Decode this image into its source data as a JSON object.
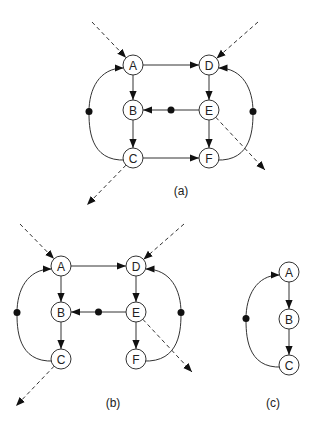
{
  "diagrams": [
    {
      "id": "a",
      "label": "(a)",
      "label_pos": [
        181,
        195
      ],
      "nodes": [
        {
          "id": "A",
          "x": 133,
          "y": 65
        },
        {
          "id": "B",
          "x": 133,
          "y": 110
        },
        {
          "id": "C",
          "x": 133,
          "y": 158
        },
        {
          "id": "D",
          "x": 209,
          "y": 65
        },
        {
          "id": "E",
          "x": 209,
          "y": 110
        },
        {
          "id": "F",
          "x": 209,
          "y": 158
        }
      ],
      "edges": [
        {
          "from": "A",
          "to": "D",
          "type": "straight"
        },
        {
          "from": "A",
          "to": "B",
          "type": "straight"
        },
        {
          "from": "B",
          "to": "C",
          "type": "straight"
        },
        {
          "from": "C",
          "to": "F",
          "type": "straight"
        },
        {
          "from": "D",
          "to": "E",
          "type": "straight"
        },
        {
          "from": "E",
          "to": "F",
          "type": "straight"
        },
        {
          "from": "E",
          "to": "B",
          "type": "straight",
          "dot": true
        },
        {
          "from": "C",
          "to": "A",
          "type": "arc",
          "bulge_x": 89,
          "dot": true
        },
        {
          "from": "F",
          "to": "D",
          "type": "arc",
          "bulge_x": 253,
          "dot": true
        }
      ],
      "dashed": [
        {
          "from": [
            92,
            22
          ],
          "to": "A",
          "arrow": "end"
        },
        {
          "from": [
            258,
            22
          ],
          "to": "D",
          "arrow": "end"
        },
        {
          "from": "C",
          "to": [
            87,
            205
          ],
          "arrow": "end"
        },
        {
          "from": "E",
          "to": [
            265,
            170
          ],
          "arrow": "end"
        }
      ]
    },
    {
      "id": "b",
      "label": "(b)",
      "label_pos": [
        113,
        407
      ],
      "nodes": [
        {
          "id": "A",
          "x": 61,
          "y": 266
        },
        {
          "id": "B",
          "x": 61,
          "y": 312
        },
        {
          "id": "C",
          "x": 61,
          "y": 359
        },
        {
          "id": "D",
          "x": 136,
          "y": 266
        },
        {
          "id": "E",
          "x": 136,
          "y": 312
        },
        {
          "id": "F",
          "x": 136,
          "y": 359
        }
      ],
      "edges": [
        {
          "from": "A",
          "to": "D",
          "type": "straight"
        },
        {
          "from": "A",
          "to": "B",
          "type": "straight"
        },
        {
          "from": "B",
          "to": "C",
          "type": "straight"
        },
        {
          "from": "D",
          "to": "E",
          "type": "straight"
        },
        {
          "from": "E",
          "to": "F",
          "type": "straight"
        },
        {
          "from": "E",
          "to": "B",
          "type": "straight",
          "dot": true
        },
        {
          "from": "C",
          "to": "A",
          "type": "arc",
          "bulge_x": 17,
          "dot": true
        },
        {
          "from": "F",
          "to": "D",
          "type": "arc",
          "bulge_x": 181,
          "dot": true
        }
      ],
      "dashed": [
        {
          "from": [
            20,
            224
          ],
          "to": "A",
          "arrow": "end"
        },
        {
          "from": [
            184,
            224
          ],
          "to": "D",
          "arrow": "end"
        },
        {
          "from": "C",
          "to": [
            16,
            406
          ],
          "arrow": "end"
        },
        {
          "from": "E",
          "to": [
            192,
            372
          ],
          "arrow": "end"
        }
      ]
    },
    {
      "id": "c",
      "label": "(c)",
      "label_pos": [
        273,
        407
      ],
      "nodes": [
        {
          "id": "A",
          "x": 289,
          "y": 272
        },
        {
          "id": "B",
          "x": 289,
          "y": 319
        },
        {
          "id": "C",
          "x": 289,
          "y": 365
        }
      ],
      "edges": [
        {
          "from": "A",
          "to": "B",
          "type": "straight"
        },
        {
          "from": "B",
          "to": "C",
          "type": "straight"
        },
        {
          "from": "C",
          "to": "A",
          "type": "arc",
          "bulge_x": 246,
          "dot": true
        }
      ],
      "dashed": []
    }
  ],
  "style": {
    "node_radius": 10,
    "stroke": "#333333",
    "dot_color": "#111111"
  }
}
